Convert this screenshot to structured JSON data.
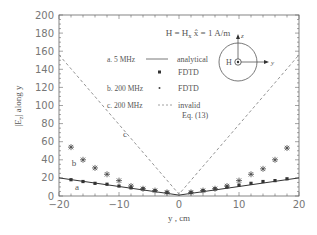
{
  "chart_data": {
    "type": "line",
    "xlabel": "y , cm",
    "ylabel": "|E_z| along y",
    "xlim": [
      -20,
      20
    ],
    "ylim": [
      0,
      200
    ],
    "xticks": [
      -20,
      -10,
      0,
      10,
      20
    ],
    "yticks": [
      0,
      20,
      40,
      60,
      80,
      100,
      120,
      140,
      160,
      180,
      200
    ],
    "grid": false,
    "legend_position": "upper center",
    "legend": [
      {
        "label": "a. 5 MHz",
        "marker": "line",
        "desc": "analytical"
      },
      {
        "label": "",
        "marker": "square",
        "desc": "FDTD"
      },
      {
        "label": "b. 200 MHz",
        "marker": "star",
        "desc": "FDTD"
      },
      {
        "label": "c. 200 MHz",
        "marker": "dashed",
        "desc": "invalid",
        "desc2": "Eq. (13)"
      }
    ],
    "curve_labels": [
      {
        "text": "a",
        "x": -17,
        "y": 7
      },
      {
        "text": "b",
        "x": -17.5,
        "y": 33
      },
      {
        "text": "c",
        "x": -9,
        "y": 65
      }
    ],
    "inset": {
      "center_label": "H",
      "axis_up": "z",
      "axis_right": "y"
    },
    "series": [
      {
        "name": "a. 5 MHz analytical",
        "style": "solid",
        "x": [
          -20,
          -10,
          0,
          10,
          20
        ],
        "y": [
          20,
          10.5,
          1,
          10.5,
          20
        ]
      },
      {
        "name": "a. 5 MHz FDTD",
        "style": "square",
        "x": [
          -18,
          -16,
          -14,
          -12,
          -10,
          -8,
          -6,
          -4,
          -2,
          2,
          4,
          6,
          8,
          10,
          12,
          14,
          16,
          18
        ],
        "y": [
          18,
          16,
          14,
          13,
          11,
          9,
          8,
          6,
          4,
          4,
          6,
          8,
          10,
          12,
          14,
          16,
          17,
          19
        ]
      },
      {
        "name": "b. 200 MHz FDTD",
        "style": "star",
        "x": [
          -18,
          -16,
          -14,
          -12,
          -10,
          -8,
          -6,
          -4,
          -2,
          2,
          4,
          6,
          8,
          10,
          12,
          14,
          16,
          18
        ],
        "y": [
          54,
          40,
          31,
          24,
          17,
          11,
          8,
          6,
          4,
          4,
          6,
          8,
          11,
          17,
          24,
          30,
          40,
          53
        ]
      },
      {
        "name": "c. 200 MHz invalid Eq. (13)",
        "style": "dashed",
        "x": [
          -20,
          0,
          20
        ],
        "y": [
          156,
          2,
          156
        ]
      }
    ]
  }
}
